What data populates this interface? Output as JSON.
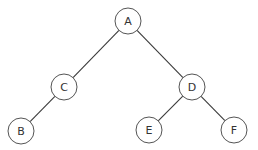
{
  "diagram": {
    "type": "binary-tree",
    "nodes": [
      {
        "id": "A",
        "label": "A",
        "x": 128,
        "y": 21
      },
      {
        "id": "C",
        "label": "C",
        "x": 64,
        "y": 87
      },
      {
        "id": "D",
        "label": "D",
        "x": 192,
        "y": 87
      },
      {
        "id": "B",
        "label": "B",
        "x": 21,
        "y": 131
      },
      {
        "id": "E",
        "label": "E",
        "x": 149,
        "y": 130
      },
      {
        "id": "F",
        "label": "F",
        "x": 234,
        "y": 130
      }
    ],
    "edges": [
      {
        "from": "A",
        "to": "C"
      },
      {
        "from": "A",
        "to": "D"
      },
      {
        "from": "C",
        "to": "B"
      },
      {
        "from": "D",
        "to": "E"
      },
      {
        "from": "D",
        "to": "F"
      }
    ],
    "node_radius": 13
  }
}
